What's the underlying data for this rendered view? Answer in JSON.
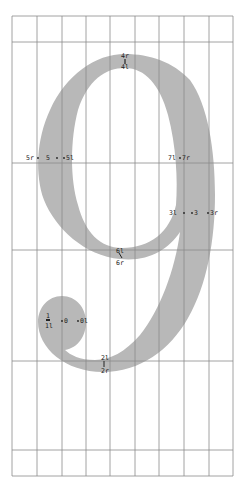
{
  "diagram": {
    "type": "glyph-construction",
    "glyph": "9",
    "colors": {
      "background": "#ffffff",
      "glyph_fill": "#b8b8b8",
      "grid_line": "#8a8a8a",
      "label": "#222222"
    },
    "grid": {
      "left": 12,
      "right": 233,
      "top": 16,
      "bottom": 476,
      "vertical_x": [
        12,
        37,
        62,
        86,
        110,
        135,
        159,
        184,
        209,
        233
      ],
      "horizontal_y": [
        16,
        42,
        163,
        250,
        361,
        450,
        476
      ]
    },
    "points": [
      {
        "label": "4r",
        "x": 125,
        "y": 57
      },
      {
        "label": "4l",
        "x": 125,
        "y": 67
      },
      {
        "label": "5r",
        "x": 30,
        "y": 158
      },
      {
        "label": "5",
        "x": 50,
        "y": 158
      },
      {
        "label": "5l",
        "x": 70,
        "y": 158
      },
      {
        "label": "7l",
        "x": 172,
        "y": 158
      },
      {
        "label": "7r",
        "x": 186,
        "y": 158
      },
      {
        "label": "3l",
        "x": 175,
        "y": 213
      },
      {
        "label": "3",
        "x": 197,
        "y": 213
      },
      {
        "label": "3r",
        "x": 214,
        "y": 213
      },
      {
        "label": "6l",
        "x": 120,
        "y": 251
      },
      {
        "label": "6r",
        "x": 120,
        "y": 262
      },
      {
        "label": "1",
        "x": 48,
        "y": 318
      },
      {
        "label": "1l",
        "x": 48,
        "y": 325
      },
      {
        "label": "0",
        "x": 66,
        "y": 321
      },
      {
        "label": "0l",
        "x": 83,
        "y": 321
      },
      {
        "label": "2l",
        "x": 105,
        "y": 358
      },
      {
        "label": "2r",
        "x": 105,
        "y": 371
      }
    ]
  }
}
